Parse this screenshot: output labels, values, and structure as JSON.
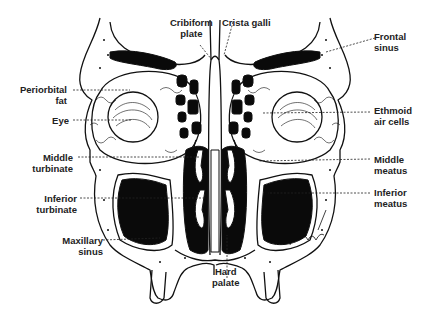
{
  "diagram": {
    "colors": {
      "ink": "#111111",
      "cavity": "#0a0a0a",
      "background": "#ffffff",
      "text": "#222222"
    },
    "labels": {
      "cribriform_plate": {
        "line1": "Cribiform",
        "line2": "plate"
      },
      "crista_galli": {
        "line1": "Crista galli"
      },
      "frontal_sinus": {
        "line1": "Frontal",
        "line2": "sinus"
      },
      "periorbital_fat": {
        "line1": "Periorbital",
        "line2": "fat"
      },
      "eye": {
        "line1": "Eye"
      },
      "ethmoid_air_cells": {
        "line1": "Ethmoid",
        "line2": "air cells"
      },
      "middle_turbinate": {
        "line1": "Middle",
        "line2": "turbinate"
      },
      "middle_meatus": {
        "line1": "Middle",
        "line2": "meatus"
      },
      "inferior_turbinate": {
        "line1": "Inferior",
        "line2": "turbinate"
      },
      "inferior_meatus": {
        "line1": "Inferior",
        "line2": "meatus"
      },
      "maxillary_sinus": {
        "line1": "Maxillary",
        "line2": "sinus"
      },
      "hard_palate": {
        "line1": "Hard",
        "line2": "palate"
      }
    },
    "signature": "Ashworth"
  }
}
